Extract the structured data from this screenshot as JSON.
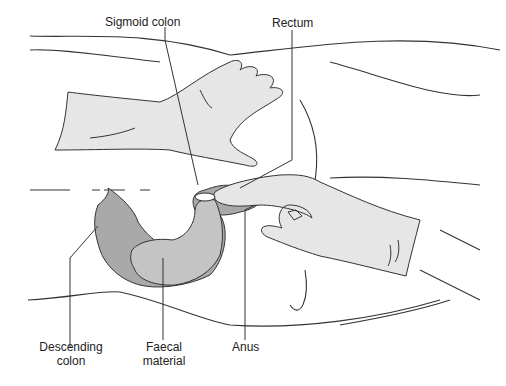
{
  "diagram": {
    "labels": {
      "sigmoid_colon": "Sigmoid colon",
      "rectum": "Rectum",
      "descending_colon_1": "Descending",
      "descending_colon_2": "colon",
      "faecal_material_1": "Faecal",
      "faecal_material_2": "material",
      "anus": "Anus"
    },
    "colors": {
      "glove": "#e6e6e6",
      "colon_dark": "#a9a9a9",
      "faecal": "#c4c4c4",
      "stroke": "#333333",
      "background": "#ffffff"
    }
  }
}
